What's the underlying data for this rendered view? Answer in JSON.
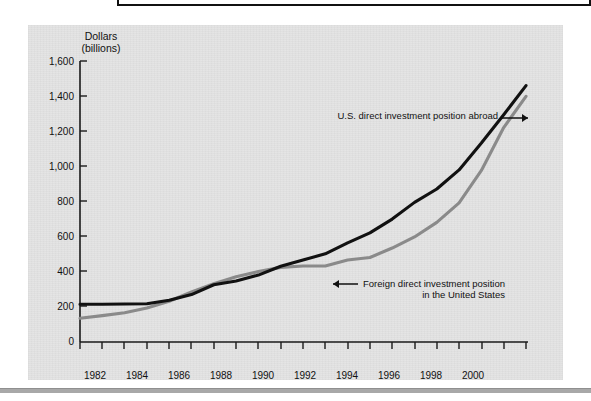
{
  "figure": {
    "y_axis_title_line1": "Dollars",
    "y_axis_title_line2": "(billions)",
    "y_ticks": [
      "1,600",
      "1,400",
      "1,200",
      "1,000",
      "800",
      "600",
      "400",
      "200",
      "0"
    ],
    "x_ticks": [
      "1982",
      "1984",
      "1986",
      "1988",
      "1990",
      "1992",
      "1994",
      "1996",
      "1998",
      "2000"
    ],
    "annotations": {
      "series_black": "U.S. direct investment position abroad",
      "series_gray_line1": "Foreign direct investment position",
      "series_gray_line2": "in the United States"
    },
    "colors": {
      "background": "#e3e3e3",
      "series_black": "#111111",
      "series_gray": "#8a8a8a",
      "axis": "#1a1a1a",
      "page": "#ffffff",
      "rule": "#a8a8a8"
    }
  },
  "chart_data": {
    "type": "line",
    "title": "",
    "xlabel": "",
    "ylabel": "Dollars (billions)",
    "xlim": [
      1981,
      2001
    ],
    "ylim": [
      0,
      1600
    ],
    "grid": false,
    "legend": "annotated-inline",
    "x": [
      1981,
      1982,
      1983,
      1984,
      1985,
      1986,
      1987,
      1988,
      1989,
      1990,
      1991,
      1992,
      1993,
      1994,
      1995,
      1996,
      1997,
      1998,
      1999,
      2000,
      2001
    ],
    "series": [
      {
        "name": "U.S. direct investment position abroad",
        "color": "#111111",
        "values": [
          215,
          215,
          216,
          218,
          238,
          270,
          326,
          347,
          381,
          431,
          467,
          502,
          564,
          621,
          700,
          795,
          871,
          980,
          1133,
          1294,
          1460
        ]
      },
      {
        "name": "Foreign direct investment position in the United States",
        "color": "#8a8a8a",
        "values": [
          135,
          150,
          167,
          193,
          232,
          285,
          332,
          372,
          401,
          425,
          433,
          433,
          467,
          481,
          535,
          598,
          681,
          792,
          977,
          1221,
          1399
        ]
      }
    ],
    "annotations": [
      {
        "text": "U.S. direct investment position abroad",
        "target_series": "U.S. direct investment position abroad",
        "arrow": "right"
      },
      {
        "text": "Foreign direct investment position in the United States",
        "target_series": "Foreign direct investment position in the United States",
        "arrow": "left"
      }
    ]
  }
}
